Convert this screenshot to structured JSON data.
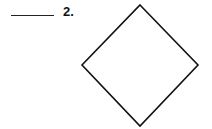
{
  "question": {
    "number_label": "2.",
    "answer_blank": "",
    "shape": {
      "type": "diamond",
      "stroke": "#111111",
      "fill": "#ffffff",
      "points": [
        [
          140,
          5
        ],
        [
          198,
          65
        ],
        [
          140,
          126
        ],
        [
          82,
          65
        ]
      ]
    }
  }
}
